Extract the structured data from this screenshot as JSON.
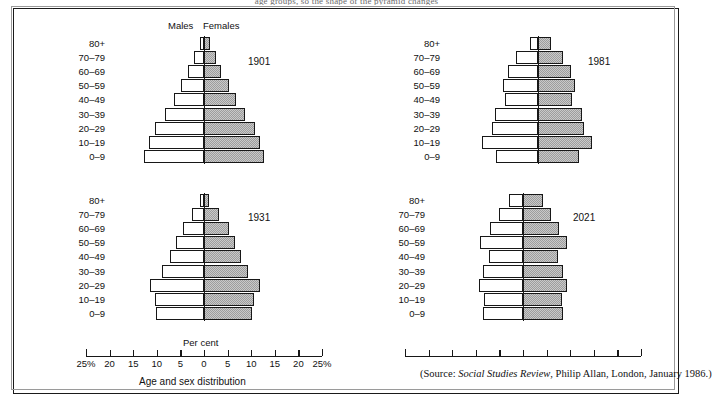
{
  "caption_fragment": "age groups, so the shape of the pyramid changes",
  "header": {
    "males_label": "Males",
    "females_label": "Females"
  },
  "axis": {
    "per_cent_label": "Per cent",
    "title": "Age and sex distribution",
    "tick_labels": [
      "25%",
      "20",
      "15",
      "10",
      "5",
      "0",
      "5",
      "10",
      "15",
      "20",
      "25%"
    ],
    "tick_values": [
      -25,
      -20,
      -15,
      -10,
      -5,
      0,
      5,
      10,
      15,
      20,
      25
    ],
    "max_percent": 25
  },
  "source": {
    "prefix": "(Source: ",
    "italic": "Social Studies Review",
    "suffix": ", Philip Allan, London, January 1986.)"
  },
  "age_groups": [
    "80+",
    "70–79",
    "60–69",
    "50–59",
    "40–49",
    "30–39",
    "20–29",
    "10–19",
    "0–9"
  ],
  "colors": {
    "male_fill": "#ffffff",
    "female_fill": "#c9c9c9",
    "outline": "#171717",
    "frame": "#1a1a1a",
    "background": "#ffffff"
  },
  "chart_data": {
    "type": "bar",
    "title": "Age and sex distribution",
    "subtitle": "Population pyramids, United Kingdom",
    "xlabel": "Per cent",
    "ylabel": "Age group",
    "xlim": [
      -25,
      25
    ],
    "grid": false,
    "legend_position": "top-center",
    "legend": [
      "Males",
      "Females"
    ],
    "categories": [
      "80+",
      "70–79",
      "60–69",
      "50–59",
      "40–49",
      "30–39",
      "20–29",
      "10–19",
      "0–9"
    ],
    "panels": [
      {
        "year": "1901",
        "position": "top-left",
        "series": [
          {
            "name": "Males",
            "values": [
              0.9,
              2.1,
              3.3,
              4.8,
              6.4,
              8.2,
              10.3,
              11.6,
              12.8
            ]
          },
          {
            "name": "Females",
            "values": [
              1.2,
              2.5,
              3.6,
              5.2,
              6.8,
              8.6,
              10.8,
              11.9,
              12.8
            ]
          }
        ]
      },
      {
        "year": "1931",
        "position": "bottom-left",
        "series": [
          {
            "name": "Males",
            "values": [
              0.8,
              2.6,
              4.5,
              6.0,
              7.2,
              9.0,
              11.5,
              10.4,
              10.2
            ]
          },
          {
            "name": "Females",
            "values": [
              1.1,
              3.2,
              5.2,
              6.6,
              7.8,
              9.4,
              11.8,
              10.6,
              10.2
            ]
          }
        ]
      },
      {
        "year": "1981",
        "position": "top-right",
        "series": [
          {
            "name": "Males",
            "values": [
              1.6,
              4.6,
              6.4,
              7.4,
              7.0,
              9.2,
              9.8,
              11.8,
              9.0
            ]
          },
          {
            "name": "Females",
            "values": [
              2.8,
              5.4,
              7.0,
              7.8,
              7.2,
              9.4,
              9.8,
              11.4,
              8.6
            ]
          }
        ]
      },
      {
        "year": "2021",
        "position": "bottom-right",
        "series": [
          {
            "name": "Males",
            "values": [
              3.0,
              5.0,
              7.0,
              9.2,
              7.2,
              8.4,
              9.4,
              8.2,
              8.4
            ]
          },
          {
            "name": "Females",
            "values": [
              4.2,
              6.0,
              7.6,
              9.4,
              7.4,
              8.4,
              9.4,
              8.2,
              8.4
            ]
          }
        ]
      }
    ]
  }
}
